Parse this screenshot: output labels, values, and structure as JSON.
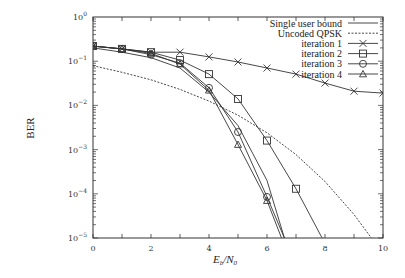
{
  "chart_data": {
    "type": "line",
    "title": "",
    "xlabel": "E_b/N_0",
    "ylabel": "BER",
    "xlim": [
      0,
      10
    ],
    "ylim": [
      1e-05,
      1
    ],
    "yscale": "log",
    "grid": false,
    "legend_position": "top-right",
    "x_ticks": [
      0,
      2,
      4,
      6,
      8,
      10
    ],
    "x_tick_labels": [
      "0",
      "2",
      "4",
      "6",
      "8",
      "10"
    ],
    "y_ticks": [
      1,
      0.1,
      0.01,
      0.001,
      0.0001,
      1e-05
    ],
    "y_tick_labels": [
      "10^0",
      "10^-1",
      "10^-2",
      "10^-3",
      "10^-4",
      "10^-5"
    ],
    "series": [
      {
        "name": "Single user bound",
        "style": "solid",
        "marker": "none",
        "x": [
          0,
          1,
          2,
          3,
          4,
          5,
          6,
          6.6
        ],
        "values": [
          0.2,
          0.16,
          0.12,
          0.07,
          0.02,
          0.0035,
          0.0002,
          1e-05
        ]
      },
      {
        "name": "Uncoded QPSK",
        "style": "dashed",
        "marker": "none",
        "x": [
          0,
          1,
          2,
          3,
          4,
          5,
          6,
          7,
          8,
          9,
          9.6
        ],
        "values": [
          0.079,
          0.056,
          0.038,
          0.023,
          0.0125,
          0.006,
          0.0024,
          0.00077,
          0.00019,
          3.4e-05,
          1e-05
        ]
      },
      {
        "name": "iteration 1",
        "style": "solid",
        "marker": "x",
        "x": [
          0,
          1,
          2,
          3,
          4,
          5,
          6,
          7,
          8,
          9,
          10
        ],
        "values": [
          0.22,
          0.19,
          0.16,
          0.16,
          0.125,
          0.096,
          0.07,
          0.051,
          0.032,
          0.021,
          0.019
        ]
      },
      {
        "name": "iteration 2",
        "style": "solid",
        "marker": "square",
        "x": [
          0,
          1,
          2,
          3,
          4,
          5,
          6,
          7,
          7.9
        ],
        "values": [
          0.22,
          0.19,
          0.16,
          0.106,
          0.051,
          0.014,
          0.0016,
          0.00013,
          1e-05
        ]
      },
      {
        "name": "iteration 3",
        "style": "solid",
        "marker": "circle",
        "x": [
          0,
          1,
          2,
          3,
          4,
          5,
          6,
          6.6
        ],
        "values": [
          0.22,
          0.19,
          0.14,
          0.09,
          0.025,
          0.0025,
          8.5e-05,
          1e-05
        ]
      },
      {
        "name": "iteration 4",
        "style": "solid",
        "marker": "triangle",
        "x": [
          0,
          1,
          2,
          3,
          4,
          5,
          6,
          6.5
        ],
        "values": [
          0.22,
          0.19,
          0.15,
          0.086,
          0.022,
          0.0013,
          7e-05,
          1e-05
        ]
      }
    ]
  },
  "labels": {
    "ylabel": "BER",
    "xlabel_main": "E",
    "xlabel_sub1": "b",
    "xlabel_slash": "/N",
    "xlabel_sub2": "0"
  }
}
